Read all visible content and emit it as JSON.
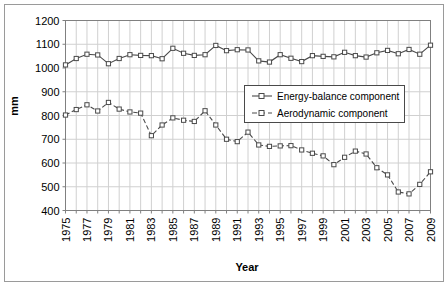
{
  "chart_data": {
    "type": "line",
    "title": "",
    "xlabel": "Year",
    "ylabel": "mm",
    "xlim": [
      1975,
      2009
    ],
    "ylim": [
      400,
      1200
    ],
    "ytick_step": 100,
    "yticks": [
      400,
      500,
      600,
      700,
      800,
      900,
      1000,
      1100,
      1200
    ],
    "xticks": [
      1975,
      1977,
      1979,
      1981,
      1983,
      1985,
      1987,
      1989,
      1991,
      1993,
      1995,
      1997,
      1999,
      2001,
      2003,
      2005,
      2007,
      2009
    ],
    "x": [
      1975,
      1976,
      1977,
      1978,
      1979,
      1980,
      1981,
      1982,
      1983,
      1984,
      1985,
      1986,
      1987,
      1988,
      1989,
      1990,
      1991,
      1992,
      1993,
      1994,
      1995,
      1996,
      1997,
      1998,
      1999,
      2000,
      2001,
      2002,
      2003,
      2004,
      2005,
      2006,
      2007,
      2008,
      2009
    ],
    "grid": {
      "x": true,
      "y": true
    },
    "legend_position": "center-right",
    "series": [
      {
        "name": "Energy-balance component",
        "style": "solid",
        "marker": "square-open",
        "color": "#4a4a4a",
        "values": [
          1013,
          1040,
          1058,
          1055,
          1018,
          1040,
          1056,
          1053,
          1052,
          1039,
          1083,
          1062,
          1053,
          1056,
          1095,
          1073,
          1077,
          1076,
          1030,
          1025,
          1056,
          1041,
          1027,
          1052,
          1049,
          1047,
          1066,
          1052,
          1046,
          1064,
          1074,
          1060,
          1078,
          1058,
          1096
        ]
      },
      {
        "name": "Aerodynamic component",
        "style": "dashed",
        "marker": "square-open",
        "color": "#4a4a4a",
        "values": [
          802,
          825,
          845,
          819,
          855,
          827,
          815,
          810,
          715,
          760,
          790,
          780,
          775,
          820,
          760,
          700,
          690,
          730,
          676,
          670,
          672,
          673,
          655,
          641,
          630,
          593,
          624,
          650,
          638,
          580,
          550,
          478,
          470,
          510,
          563
        ]
      }
    ]
  },
  "legend": {
    "items": [
      {
        "label": "Energy-balance component",
        "style": "solid"
      },
      {
        "label": "Aerodynamic component",
        "style": "dashed"
      }
    ]
  },
  "axes": {
    "y_title": "mm",
    "x_title": "Year"
  }
}
